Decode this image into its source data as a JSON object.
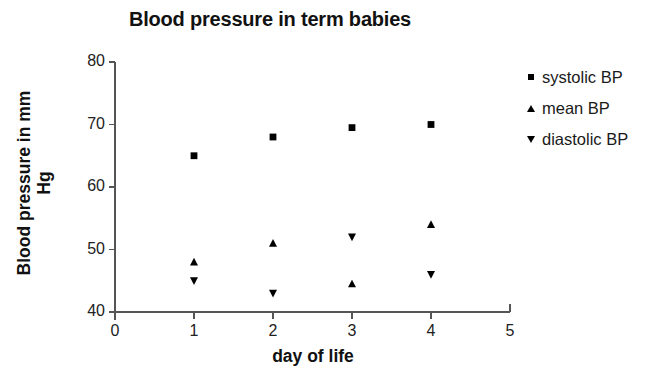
{
  "chart_data": {
    "type": "scatter",
    "title": "Blood pressure in term babies",
    "xlabel": "day of life",
    "ylabel": "Blood pressure in mm Hg",
    "ylabel_line1": "Blood pressure in mm",
    "ylabel_line2": "Hg",
    "x": [
      1,
      2,
      3,
      4
    ],
    "xlim": [
      0,
      5
    ],
    "ylim": [
      40,
      80
    ],
    "xticks": [
      "0",
      "1",
      "2",
      "3",
      "4",
      "5"
    ],
    "yticks": [
      "40",
      "50",
      "60",
      "70",
      "80"
    ],
    "xtick_values": [
      0,
      1,
      2,
      3,
      4,
      5
    ],
    "ytick_values": [
      40,
      50,
      60,
      70,
      80
    ],
    "grid": false,
    "legend_position": "right",
    "series": [
      {
        "name": "systolic BP",
        "marker": "square",
        "values": [
          65.0,
          68.0,
          69.5,
          70.0
        ]
      },
      {
        "name": "mean BP",
        "marker": "triangle-up",
        "values": [
          48.0,
          51.0,
          52.0,
          54.0
        ]
      },
      {
        "name": "diastolic BP",
        "marker": "triangle-down",
        "values": [
          45.0,
          43.0,
          44.5,
          46.0
        ]
      }
    ],
    "plotted_markers": [
      {
        "series": "systolic BP",
        "marker": "square",
        "x": 1,
        "y": 65.0
      },
      {
        "series": "systolic BP",
        "marker": "square",
        "x": 2,
        "y": 68.0
      },
      {
        "series": "systolic BP",
        "marker": "square",
        "x": 3,
        "y": 69.5
      },
      {
        "series": "systolic BP",
        "marker": "square",
        "x": 4,
        "y": 70.0
      },
      {
        "series": "mean BP",
        "marker": "triangle-up",
        "x": 1,
        "y": 48.0
      },
      {
        "series": "mean BP",
        "marker": "triangle-up",
        "x": 2,
        "y": 51.0
      },
      {
        "series": "mean BP",
        "marker": "triangle-up",
        "x": 3,
        "y": 44.5
      },
      {
        "series": "mean BP",
        "marker": "triangle-up",
        "x": 4,
        "y": 54.0
      },
      {
        "series": "diastolic BP",
        "marker": "triangle-down",
        "x": 1,
        "y": 45.0
      },
      {
        "series": "diastolic BP",
        "marker": "triangle-down",
        "x": 2,
        "y": 43.0
      },
      {
        "series": "diastolic BP",
        "marker": "triangle-down",
        "x": 3,
        "y": 52.0
      },
      {
        "series": "diastolic BP",
        "marker": "triangle-down",
        "x": 4,
        "y": 46.0
      }
    ],
    "colors": {
      "marker": "#000000",
      "axis": "#555555",
      "text": "#111111",
      "background": "#ffffff"
    }
  },
  "legend": {
    "items": [
      {
        "label": "systolic BP",
        "marker": "square"
      },
      {
        "label": "mean BP",
        "marker": "triangle-up"
      },
      {
        "label": "diastolic BP",
        "marker": "triangle-down"
      }
    ]
  }
}
